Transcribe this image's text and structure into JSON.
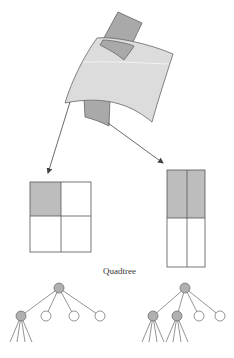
{
  "diagram": {
    "caption": "Quadtree",
    "colors": {
      "background": "#ffffff",
      "sheet_fill": "#dcdcdc",
      "patch_fill": "#a9a9a9",
      "shaded_cell": "#bdbdbd",
      "stroke": "#555555",
      "node_filled": "#b0b0b0",
      "node_empty": "#ffffff"
    },
    "surface": {
      "description": "Curved surface sheet with two dark patches mapped to quadtree cells"
    },
    "grids": [
      {
        "name": "left-grid",
        "rows": 2,
        "cols": 2,
        "shaded_cells": [
          "top-left"
        ]
      },
      {
        "name": "right-grid",
        "rows": 2,
        "cols": 2,
        "shaded_cells": [
          "top-left",
          "top-right"
        ]
      }
    ],
    "trees": [
      {
        "name": "left-tree",
        "root": "filled",
        "children": [
          "filled",
          "empty",
          "empty",
          "empty"
        ],
        "grandchildren_of_first": 4
      },
      {
        "name": "right-tree",
        "root": "filled",
        "children": [
          "filled",
          "filled",
          "empty",
          "empty"
        ],
        "grandchildren_per_filled": 4
      }
    ]
  }
}
